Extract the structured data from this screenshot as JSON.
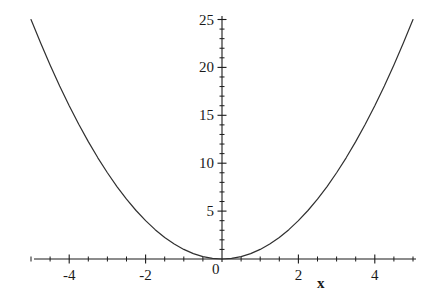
{
  "chart_data": {
    "type": "line",
    "title": "",
    "subtitle": "",
    "xlabel": "x",
    "ylabel": "",
    "function": "y = x^2",
    "xlim": [
      -5,
      5
    ],
    "ylim": [
      0,
      25.5
    ],
    "grid": false,
    "legend": null,
    "annotations": [],
    "x_ticks_major": [
      -4,
      -2,
      0,
      2,
      4
    ],
    "x_tick_labels": [
      "-4",
      "-2",
      "0",
      "2",
      "4"
    ],
    "x_tick_minor_step": 0.5,
    "y_ticks_major": [
      5,
      10,
      15,
      20,
      25
    ],
    "y_tick_labels": [
      "5",
      "10",
      "15",
      "20",
      "25"
    ],
    "y_tick_minor_step": 1,
    "origin_label": "0",
    "series": [
      {
        "name": "y = x^2",
        "color": "#303030",
        "x": [
          -5,
          -4.75,
          -4.5,
          -4.25,
          -4,
          -3.75,
          -3.5,
          -3.25,
          -3,
          -2.75,
          -2.5,
          -2.25,
          -2,
          -1.75,
          -1.5,
          -1.25,
          -1,
          -0.75,
          -0.5,
          -0.25,
          0,
          0.25,
          0.5,
          0.75,
          1,
          1.25,
          1.5,
          1.75,
          2,
          2.25,
          2.5,
          2.75,
          3,
          3.25,
          3.5,
          3.75,
          4,
          4.25,
          4.5,
          4.75,
          5
        ],
        "values": [
          25,
          22.5625,
          20.25,
          18.0625,
          16,
          14.0625,
          12.25,
          10.5625,
          9,
          7.5625,
          6.25,
          5.0625,
          4,
          3.0625,
          2.25,
          1.5625,
          1,
          0.5625,
          0.25,
          0.0625,
          0,
          0.0625,
          0.25,
          0.5625,
          1,
          1.5625,
          2.25,
          3.0625,
          4,
          5.0625,
          6.25,
          7.5625,
          9,
          10.5625,
          12.25,
          14.0625,
          16,
          18.0625,
          20.25,
          22.5625,
          25
        ]
      }
    ]
  },
  "figure": {
    "background_color": "#ffffff",
    "axis_color": "#1a1a1a",
    "curve_color": "#303030"
  },
  "labels": {
    "x_axis_name": "x",
    "origin": "0",
    "y": [
      "5",
      "10",
      "15",
      "20",
      "25"
    ],
    "x": [
      "-4",
      "-2",
      "2",
      "4"
    ]
  }
}
